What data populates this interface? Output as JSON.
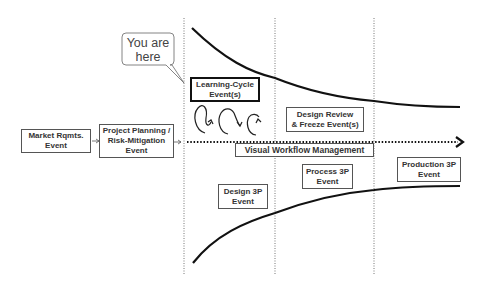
{
  "diagram": {
    "callout": {
      "line1": "You are",
      "line2": "here"
    },
    "events": {
      "market": {
        "line1": "Market Rqmts.",
        "line2": "Event"
      },
      "planning": {
        "line1": "Project Planning /",
        "line2": "Risk-Mitigation",
        "line3": "Event"
      },
      "learning": {
        "line1": "Learning-Cycle",
        "line2": "Event(s)"
      },
      "design_review": {
        "line1": "Design Review",
        "line2": "& Freeze Event(s)"
      },
      "vwm": {
        "label": "Visual Workflow Management"
      },
      "design3p": {
        "line1": "Design 3P",
        "line2": "Event"
      },
      "process3p": {
        "line1": "Process 3P",
        "line2": "Event"
      },
      "production3p": {
        "line1": "Production 3P",
        "line2": "Event"
      }
    },
    "colors": {
      "line": "#111111",
      "box_border": "#555555",
      "text": "#333333"
    }
  }
}
